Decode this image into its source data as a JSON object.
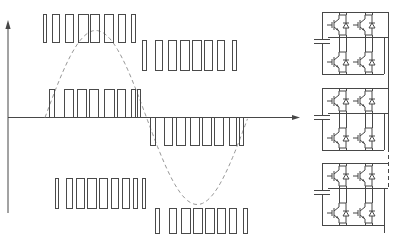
{
  "figure": {
    "background": "#ffffff",
    "line_color": "#474747",
    "pulse_color": "#4a4a4a",
    "sine_color": "#979797"
  },
  "chart_data": {
    "type": "line",
    "xlabel": "",
    "ylabel": "",
    "grid": false,
    "legend": false,
    "axes": {
      "x_axis": {
        "y": 117.5,
        "x_start": 8,
        "x_end": 293,
        "arrow_tip_x": 300
      },
      "y_axis": {
        "x": 8,
        "y_bottom": 213,
        "y_top": 26,
        "arrow_tip_y": 20
      }
    },
    "sine_reference": {
      "style": "dashed",
      "x_start": 45,
      "period_px": 203,
      "amplitude_px": 87,
      "center_y": 117.5,
      "zero_crossings_x": [
        45,
        146.5,
        248
      ],
      "peak": {
        "x": 96,
        "y": 31
      },
      "trough": {
        "x": 197,
        "y": 204
      }
    },
    "pulse_groups": [
      {
        "name": "cell1-positive",
        "baseline_y": 42,
        "direction": "up",
        "height": 28,
        "pulses": [
          [
            43,
            3
          ],
          [
            52,
            7
          ],
          [
            65,
            8
          ],
          [
            78,
            10
          ],
          [
            90,
            9
          ],
          [
            104,
            9
          ],
          [
            118,
            7
          ],
          [
            131,
            4
          ]
        ]
      },
      {
        "name": "cell1-negative",
        "baseline_y": 40,
        "direction": "down",
        "height": 30,
        "pulses": [
          [
            142,
            4
          ],
          [
            155,
            7
          ],
          [
            168,
            8
          ],
          [
            180,
            9
          ],
          [
            192,
            9
          ],
          [
            204,
            8
          ],
          [
            217,
            7
          ],
          [
            232,
            4
          ]
        ]
      },
      {
        "name": "cell2-positive",
        "baseline_y": 117.5,
        "direction": "up",
        "height": 28,
        "pulses": [
          [
            49,
            5
          ],
          [
            64,
            9
          ],
          [
            77,
            9
          ],
          [
            89,
            9
          ],
          [
            104,
            10
          ],
          [
            117,
            8
          ],
          [
            131,
            4
          ],
          [
            137,
            3
          ]
        ]
      },
      {
        "name": "cell2-negative",
        "baseline_y": 117.5,
        "direction": "down",
        "height": 27.5,
        "pulses": [
          [
            150,
            5
          ],
          [
            164,
            8
          ],
          [
            176,
            9
          ],
          [
            190,
            9
          ],
          [
            202,
            9
          ],
          [
            214,
            9
          ],
          [
            229,
            7
          ],
          [
            239,
            4
          ]
        ]
      },
      {
        "name": "cell3-positive",
        "baseline_y": 208,
        "direction": "up",
        "height": 30,
        "pulses": [
          [
            55,
            3
          ],
          [
            66,
            6
          ],
          [
            76,
            8
          ],
          [
            87,
            9
          ],
          [
            99,
            8
          ],
          [
            111,
            7
          ],
          [
            122,
            7
          ],
          [
            133,
            4
          ],
          [
            142,
            3
          ]
        ]
      },
      {
        "name": "cell3-negative",
        "baseline_y": 208,
        "direction": "down",
        "height": 25,
        "pulses": [
          [
            155,
            4
          ],
          [
            169,
            7
          ],
          [
            181,
            9
          ],
          [
            193,
            9
          ],
          [
            205,
            9
          ],
          [
            217,
            8
          ],
          [
            229,
            7
          ],
          [
            243,
            4
          ]
        ]
      }
    ]
  },
  "circuit": {
    "type": "cascaded-h-bridge-inverter",
    "switch_type": "igbt-with-antiparallel-diode",
    "switches_per_cell": 4,
    "dc_link": "capacitor",
    "cells": [
      {
        "name": "cell-1",
        "top_y": 12
      },
      {
        "name": "cell-2",
        "top_y": 88
      },
      {
        "name": "cell-3",
        "top_y": 163
      }
    ],
    "continuation": {
      "style": "dashed",
      "x": 388,
      "y1": 148,
      "y2": 188
    }
  }
}
